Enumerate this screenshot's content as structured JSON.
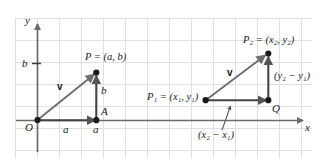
{
  "figure": {
    "background_color": "#ffffff",
    "grid_color": "#dfe0e2",
    "axis_color": "#6b6b6b",
    "vector_color": "#6e6e6e",
    "point_color": "#1a1a1a",
    "text_color": "#1a1a1a"
  },
  "axes": {
    "y_label": "y",
    "x_label": "x",
    "origin_label": "O",
    "y_tick_label": "b"
  },
  "left_diagram": {
    "name": "vector-from-origin",
    "point_label": "P = (a, b)",
    "foot_point_label": "A",
    "vector_label": "v",
    "horizontal_component_label": "a",
    "vertical_component_label": "b",
    "x_foot_label": "a",
    "origin_label": "O"
  },
  "right_diagram": {
    "name": "vector-between-two-points",
    "start_point_label": "P₁ = (x₁, y₁)",
    "end_point_label": "P₂ = (x₂, y₂)",
    "corner_point_label": "Q",
    "vector_label": "v",
    "horizontal_component_label": "(x₂ − x₁)",
    "vertical_component_label": "(y₂ − y₁)"
  },
  "labels": {
    "p_name": "P",
    "p_eq": "= (",
    "a_var": "a",
    "comma": ", ",
    "b_var": "b",
    "close": ")",
    "p1_name": "P",
    "p1_sub": "1",
    "p2_name": "P",
    "p2_sub": "2",
    "x_var": "x",
    "y_var": "y",
    "minus": "−",
    "sub1": "1",
    "sub2": "2"
  }
}
